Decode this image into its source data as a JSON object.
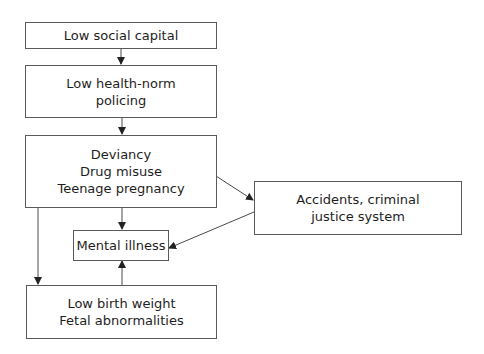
{
  "diagram": {
    "nodes": {
      "low_social_capital": {
        "lines": [
          "Low social capital"
        ]
      },
      "low_health_norm_policing": {
        "lines": [
          "Low health-norm",
          "policing"
        ]
      },
      "deviancy": {
        "lines": [
          "Deviancy",
          "Drug misuse",
          "Teenage pregnancy"
        ]
      },
      "accidents": {
        "lines": [
          "Accidents, criminal",
          "justice system"
        ]
      },
      "mental_illness": {
        "lines": [
          "Mental illness"
        ]
      },
      "low_birth_weight": {
        "lines": [
          "Low birth weight",
          "Fetal abnormalities"
        ]
      }
    },
    "edges": [
      {
        "from": "low_social_capital",
        "to": "low_health_norm_policing"
      },
      {
        "from": "low_health_norm_policing",
        "to": "deviancy"
      },
      {
        "from": "deviancy",
        "to": "mental_illness"
      },
      {
        "from": "deviancy",
        "to": "accidents"
      },
      {
        "from": "deviancy",
        "to": "low_birth_weight"
      },
      {
        "from": "accidents",
        "to": "mental_illness"
      },
      {
        "from": "low_birth_weight",
        "to": "mental_illness"
      }
    ],
    "colors": {
      "line": "#4a4a4a",
      "border": "#5a5a5a",
      "text": "#1e1e1e"
    }
  }
}
